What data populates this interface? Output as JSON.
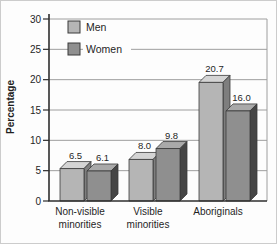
{
  "figure": {
    "background": "#fdfdfd",
    "border_color": "#cccccc"
  },
  "chart_data": {
    "type": "bar",
    "style": "3d-grouped-column",
    "title": "",
    "xlabel": "",
    "ylabel": "Percentage",
    "ylim": [
      0,
      30
    ],
    "yticks": [
      0,
      5,
      10,
      15,
      20,
      25,
      30
    ],
    "grid": true,
    "legend_position": "top-left",
    "categories": [
      "Non-visible minorities",
      "Visible minorities",
      "Aboriginals"
    ],
    "series": [
      {
        "name": "Men",
        "values": [
          6.5,
          8.0,
          20.7
        ],
        "front_color": "#b5b5b5",
        "top_color": "#d4d4d4",
        "side_color": "#7e7e7e"
      },
      {
        "name": "Women",
        "values": [
          6.1,
          9.8,
          16.0
        ],
        "front_color": "#8f8f8f",
        "top_color": "#a9a9a9",
        "side_color": "#454545"
      }
    ],
    "value_label_decimals": 1,
    "axis_color": "#2e2e2e",
    "grid_color": "#9e9e9e",
    "outline_color": "#3a3a3a",
    "text_color": "#1f1f1f"
  }
}
